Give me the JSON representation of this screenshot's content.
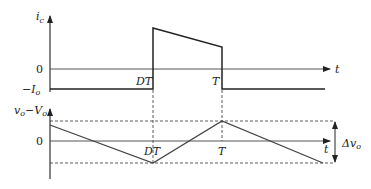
{
  "top_plot": {
    "y_axis_label": "i_c",
    "y_ticks": [
      "0",
      "−I_o"
    ],
    "x_axis_label": "t",
    "x_marks": [
      "DT",
      "T"
    ],
    "waveform": "capacitor current: −I_o for 0<t<DT, jumps to peak then decreases linearly until T, then returns to −I_o"
  },
  "bottom_plot": {
    "y_axis_label": "v_o − V_o",
    "y_ticks": [
      "0"
    ],
    "x_axis_label": "t",
    "x_marks": [
      "DT",
      "T"
    ],
    "ripple_label": "Δv_o",
    "waveform": "output voltage ripple: decreases linearly to minimum at DT, rises to maximum at T, then decreases"
  },
  "labels": {
    "ic": "i",
    "ic_sub": "c",
    "zero_top": "0",
    "neg_io": "−I",
    "neg_io_sub": "o",
    "t_top": "t",
    "dt_top": "DT",
    "T_top": "T",
    "vo": "v",
    "vo_sub": "o",
    "minus": "−V",
    "Vo_sub": "o",
    "zero_bottom": "0",
    "dt_bottom": "DT",
    "T_bottom": "T",
    "t_bottom": "t",
    "delta": "Δv",
    "delta_sub": "o"
  }
}
